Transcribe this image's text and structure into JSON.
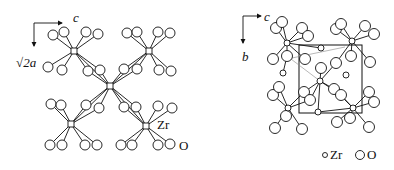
{
  "figure": {
    "left_panel": {
      "axis_horizontal_label": "c",
      "axis_vertical_label": "√2a",
      "atom_label_zr": "Zr",
      "atom_label_o": "O"
    },
    "right_panel": {
      "axis_horizontal_label": "c",
      "axis_vertical_label": "b",
      "legend": {
        "zr_label": "Zr",
        "o_label": "O"
      }
    },
    "colors": {
      "line": "#111111",
      "atom_fill": "#ffffff"
    }
  }
}
